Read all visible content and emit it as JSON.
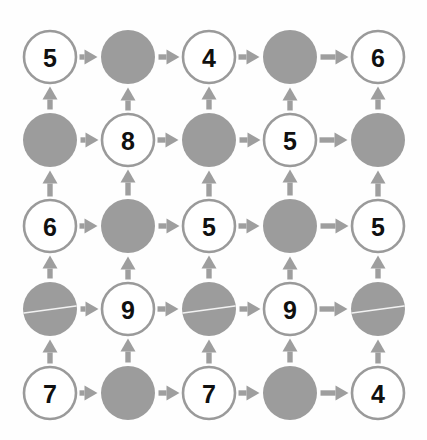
{
  "figure": {
    "name": "grid-graph-diagram",
    "background_color": "#fefefe",
    "width": 427,
    "height": 440,
    "rows": 5,
    "columns": 5
  },
  "style": {
    "filled_node_color": "#9c9c9c",
    "open_node_fill": "#ffffff",
    "open_node_stroke": "#9a9a9a",
    "label_color": "#101010",
    "arrow_color": "#9e9e9e",
    "artifact_line_color": "#f2f2f2"
  },
  "geometry": {
    "column_centers": [
      50,
      128,
      209,
      290,
      378
    ],
    "row_centers": [
      57,
      140,
      226,
      309,
      393
    ],
    "node_radius": 26,
    "filled_node_radius": 27
  },
  "nodes": [
    {
      "id": "r1c1",
      "row": 0,
      "col": 0,
      "type": "open",
      "label": "5",
      "artifact": false
    },
    {
      "id": "r1c2",
      "row": 0,
      "col": 1,
      "type": "filled",
      "label": "",
      "artifact": false
    },
    {
      "id": "r1c3",
      "row": 0,
      "col": 2,
      "type": "open",
      "label": "4",
      "artifact": false
    },
    {
      "id": "r1c4",
      "row": 0,
      "col": 3,
      "type": "filled",
      "label": "",
      "artifact": false
    },
    {
      "id": "r1c5",
      "row": 0,
      "col": 4,
      "type": "open",
      "label": "6",
      "artifact": false
    },
    {
      "id": "r2c1",
      "row": 1,
      "col": 0,
      "type": "filled",
      "label": "",
      "artifact": false
    },
    {
      "id": "r2c2",
      "row": 1,
      "col": 1,
      "type": "open",
      "label": "8",
      "artifact": false
    },
    {
      "id": "r2c3",
      "row": 1,
      "col": 2,
      "type": "filled",
      "label": "",
      "artifact": false
    },
    {
      "id": "r2c4",
      "row": 1,
      "col": 3,
      "type": "open",
      "label": "5",
      "artifact": false
    },
    {
      "id": "r2c5",
      "row": 1,
      "col": 4,
      "type": "filled",
      "label": "",
      "artifact": false
    },
    {
      "id": "r3c1",
      "row": 2,
      "col": 0,
      "type": "open",
      "label": "6",
      "artifact": false
    },
    {
      "id": "r3c2",
      "row": 2,
      "col": 1,
      "type": "filled",
      "label": "",
      "artifact": false
    },
    {
      "id": "r3c3",
      "row": 2,
      "col": 2,
      "type": "open",
      "label": "5",
      "artifact": false
    },
    {
      "id": "r3c4",
      "row": 2,
      "col": 3,
      "type": "filled",
      "label": "",
      "artifact": false
    },
    {
      "id": "r3c5",
      "row": 2,
      "col": 4,
      "type": "open",
      "label": "5",
      "artifact": false
    },
    {
      "id": "r4c1",
      "row": 3,
      "col": 0,
      "type": "filled",
      "label": "",
      "artifact": true
    },
    {
      "id": "r4c2",
      "row": 3,
      "col": 1,
      "type": "open",
      "label": "9",
      "artifact": false
    },
    {
      "id": "r4c3",
      "row": 3,
      "col": 2,
      "type": "filled",
      "label": "",
      "artifact": true
    },
    {
      "id": "r4c4",
      "row": 3,
      "col": 3,
      "type": "open",
      "label": "9",
      "artifact": false
    },
    {
      "id": "r4c5",
      "row": 3,
      "col": 4,
      "type": "filled",
      "label": "",
      "artifact": true
    },
    {
      "id": "r5c1",
      "row": 4,
      "col": 0,
      "type": "open",
      "label": "7",
      "artifact": false
    },
    {
      "id": "r5c2",
      "row": 4,
      "col": 1,
      "type": "filled",
      "label": "",
      "artifact": false
    },
    {
      "id": "r5c3",
      "row": 4,
      "col": 2,
      "type": "open",
      "label": "7",
      "artifact": false
    },
    {
      "id": "r5c4",
      "row": 4,
      "col": 3,
      "type": "filled",
      "label": "",
      "artifact": false
    },
    {
      "id": "r5c5",
      "row": 4,
      "col": 4,
      "type": "open",
      "label": "4",
      "artifact": false
    }
  ],
  "edges": {
    "horizontal_direction": "right",
    "vertical_direction": "up",
    "horizontal": [
      {
        "from": "r1c1",
        "to": "r1c2"
      },
      {
        "from": "r1c2",
        "to": "r1c3"
      },
      {
        "from": "r1c3",
        "to": "r1c4"
      },
      {
        "from": "r1c4",
        "to": "r1c5"
      },
      {
        "from": "r2c1",
        "to": "r2c2"
      },
      {
        "from": "r2c2",
        "to": "r2c3"
      },
      {
        "from": "r2c3",
        "to": "r2c4"
      },
      {
        "from": "r2c4",
        "to": "r2c5"
      },
      {
        "from": "r3c1",
        "to": "r3c2"
      },
      {
        "from": "r3c2",
        "to": "r3c3"
      },
      {
        "from": "r3c3",
        "to": "r3c4"
      },
      {
        "from": "r3c4",
        "to": "r3c5"
      },
      {
        "from": "r4c1",
        "to": "r4c2"
      },
      {
        "from": "r4c2",
        "to": "r4c3"
      },
      {
        "from": "r4c3",
        "to": "r4c4"
      },
      {
        "from": "r4c4",
        "to": "r4c5"
      },
      {
        "from": "r5c1",
        "to": "r5c2"
      },
      {
        "from": "r5c2",
        "to": "r5c3"
      },
      {
        "from": "r5c3",
        "to": "r5c4"
      },
      {
        "from": "r5c4",
        "to": "r5c5"
      }
    ],
    "vertical": [
      {
        "from": "r2c1",
        "to": "r1c1"
      },
      {
        "from": "r2c2",
        "to": "r1c2"
      },
      {
        "from": "r2c3",
        "to": "r1c3"
      },
      {
        "from": "r2c4",
        "to": "r1c4"
      },
      {
        "from": "r2c5",
        "to": "r1c5"
      },
      {
        "from": "r3c1",
        "to": "r2c1"
      },
      {
        "from": "r3c2",
        "to": "r2c2"
      },
      {
        "from": "r3c3",
        "to": "r2c3"
      },
      {
        "from": "r3c4",
        "to": "r2c4"
      },
      {
        "from": "r3c5",
        "to": "r2c5"
      },
      {
        "from": "r4c1",
        "to": "r3c1"
      },
      {
        "from": "r4c2",
        "to": "r3c2"
      },
      {
        "from": "r4c3",
        "to": "r3c3"
      },
      {
        "from": "r4c4",
        "to": "r3c4"
      },
      {
        "from": "r4c5",
        "to": "r3c5"
      },
      {
        "from": "r5c1",
        "to": "r4c1"
      },
      {
        "from": "r5c2",
        "to": "r4c2"
      },
      {
        "from": "r5c3",
        "to": "r4c3"
      },
      {
        "from": "r5c4",
        "to": "r4c4"
      },
      {
        "from": "r5c5",
        "to": "r4c5"
      }
    ]
  }
}
